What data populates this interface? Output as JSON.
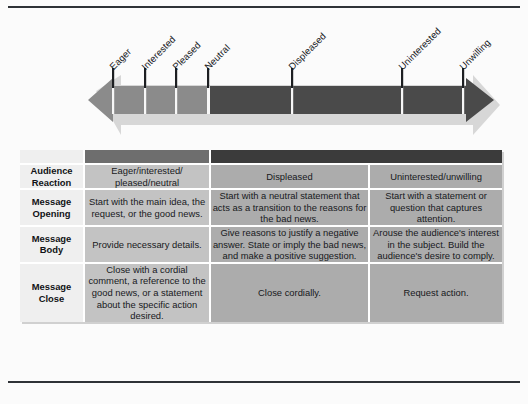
{
  "figure": {
    "continuum": {
      "left_arrow_region_label": "positive reactions",
      "right_arrow_region_label": "negative reactions",
      "positive_color": "#8b8b8b",
      "negative_color": "#4a4a4a",
      "tick_labels": [
        {
          "text": "Eager",
          "x": 113
        },
        {
          "text": "Interested",
          "x": 145
        },
        {
          "text": "Pleased",
          "x": 176
        },
        {
          "text": "Neutral",
          "x": 208
        },
        {
          "text": "Displeased",
          "x": 292
        },
        {
          "text": "Uninterested",
          "x": 402
        },
        {
          "text": "Unwilling",
          "x": 463
        }
      ]
    },
    "table": {
      "header_band": {
        "blank_label": "",
        "positive_label": "",
        "negative_label": ""
      },
      "row_headers": [
        "Audience\nReaction",
        "Message\nOpening",
        "Message\nBody",
        "Message\nClose"
      ],
      "rows": [
        {
          "header_line1": "Audience",
          "header_line2": "Reaction",
          "positive": "Eager/interested/ pleased/neutral",
          "negative": "Displeased",
          "persuasive": "Uninterested/unwilling"
        },
        {
          "header_line1": "Message",
          "header_line2": "Opening",
          "positive": "Start with the main idea, the request, or the good news.",
          "negative": "Start with a neutral statement that acts as a transition to the reasons for the bad news.",
          "persuasive": "Start with a statement or question that captures attention."
        },
        {
          "header_line1": "Message",
          "header_line2": "Body",
          "positive": "Provide necessary details.",
          "negative": "Give reasons to justify a negative answer. State or imply the bad news, and make a positive suggestion.",
          "persuasive": "Arouse the audience's interest in the subject. Build the audience's desire to comply."
        },
        {
          "header_line1": "Message",
          "header_line2": "Close",
          "positive": "Close with a cordial comment, a reference to the good news, or a statement about the specific action desired.",
          "negative": "Close cordially.",
          "persuasive": "Request action."
        }
      ]
    }
  }
}
